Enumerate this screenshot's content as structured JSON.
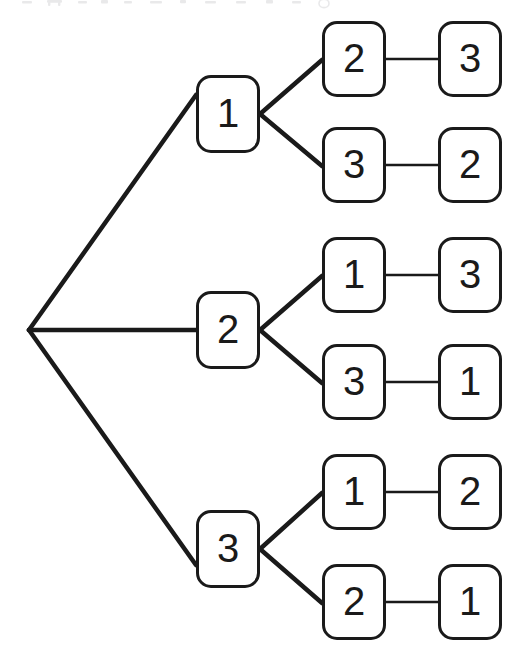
{
  "diagram": {
    "type": "tree",
    "background_color": "#ffffff",
    "stroke_color": "#1a1a1a",
    "node_fill_color": "#ffffff",
    "root": {
      "name": "root-vertex",
      "x": 29,
      "y": 330,
      "label": ""
    },
    "levels": [
      {
        "name": "level-1",
        "column_x": 196
      },
      {
        "name": "level-2",
        "column_x": 322
      },
      {
        "name": "level-3",
        "column_x": 438
      }
    ],
    "nodes": [
      {
        "id": "L1-1",
        "label": "1",
        "level": 1,
        "x": 196,
        "y": 75,
        "w": 64,
        "h": 78
      },
      {
        "id": "L1-2",
        "label": "2",
        "level": 1,
        "x": 196,
        "y": 291,
        "w": 64,
        "h": 78
      },
      {
        "id": "L1-3",
        "label": "3",
        "level": 1,
        "x": 196,
        "y": 510,
        "w": 64,
        "h": 78
      },
      {
        "id": "L2-1",
        "label": "2",
        "level": 2,
        "x": 322,
        "y": 21,
        "w": 64,
        "h": 76
      },
      {
        "id": "L2-2",
        "label": "3",
        "level": 2,
        "x": 322,
        "y": 127,
        "w": 64,
        "h": 76
      },
      {
        "id": "L2-3",
        "label": "1",
        "level": 2,
        "x": 322,
        "y": 237,
        "w": 64,
        "h": 76
      },
      {
        "id": "L2-4",
        "label": "3",
        "level": 2,
        "x": 322,
        "y": 344,
        "w": 64,
        "h": 76
      },
      {
        "id": "L2-5",
        "label": "1",
        "level": 2,
        "x": 322,
        "y": 454,
        "w": 64,
        "h": 76
      },
      {
        "id": "L2-6",
        "label": "2",
        "level": 2,
        "x": 322,
        "y": 564,
        "w": 64,
        "h": 76
      },
      {
        "id": "L3-1",
        "label": "3",
        "level": 3,
        "x": 438,
        "y": 21,
        "w": 64,
        "h": 76
      },
      {
        "id": "L3-2",
        "label": "2",
        "level": 3,
        "x": 438,
        "y": 127,
        "w": 64,
        "h": 76
      },
      {
        "id": "L3-3",
        "label": "3",
        "level": 3,
        "x": 438,
        "y": 237,
        "w": 64,
        "h": 76
      },
      {
        "id": "L3-4",
        "label": "1",
        "level": 3,
        "x": 438,
        "y": 344,
        "w": 64,
        "h": 76
      },
      {
        "id": "L3-5",
        "label": "2",
        "level": 3,
        "x": 438,
        "y": 454,
        "w": 64,
        "h": 76
      },
      {
        "id": "L3-6",
        "label": "1",
        "level": 3,
        "x": 438,
        "y": 564,
        "w": 64,
        "h": 76
      }
    ],
    "edges": [
      {
        "name": "root-to-1",
        "kind": "branch",
        "x1": 29,
        "y1": 330,
        "x2": 196,
        "y2": 95,
        "width": 4.5
      },
      {
        "name": "root-to-2",
        "kind": "branch",
        "x1": 29,
        "y1": 330,
        "x2": 196,
        "y2": 330,
        "width": 4.5
      },
      {
        "name": "root-to-3",
        "kind": "branch",
        "x1": 29,
        "y1": 330,
        "x2": 196,
        "y2": 565,
        "width": 4.5
      },
      {
        "name": "n1-to-2",
        "kind": "branch",
        "x1": 260,
        "y1": 114,
        "x2": 322,
        "y2": 60,
        "width": 4.5
      },
      {
        "name": "n1-to-3",
        "kind": "branch",
        "x1": 260,
        "y1": 114,
        "x2": 322,
        "y2": 166,
        "width": 4.5
      },
      {
        "name": "n2-to-1",
        "kind": "branch",
        "x1": 260,
        "y1": 330,
        "x2": 322,
        "y2": 276,
        "width": 4.5
      },
      {
        "name": "n2-to-3",
        "kind": "branch",
        "x1": 260,
        "y1": 330,
        "x2": 322,
        "y2": 383,
        "width": 4.5
      },
      {
        "name": "n3-to-1",
        "kind": "branch",
        "x1": 260,
        "y1": 549,
        "x2": 322,
        "y2": 493,
        "width": 4.5
      },
      {
        "name": "n3-to-2",
        "kind": "branch",
        "x1": 260,
        "y1": 549,
        "x2": 322,
        "y2": 603,
        "width": 4.5
      },
      {
        "name": "leaf-link-1",
        "kind": "link",
        "x1": 386,
        "y1": 59,
        "x2": 438,
        "y2": 59,
        "width": 2.5
      },
      {
        "name": "leaf-link-2",
        "kind": "link",
        "x1": 386,
        "y1": 165,
        "x2": 438,
        "y2": 165,
        "width": 2.5
      },
      {
        "name": "leaf-link-3",
        "kind": "link",
        "x1": 386,
        "y1": 275,
        "x2": 438,
        "y2": 275,
        "width": 2.5
      },
      {
        "name": "leaf-link-4",
        "kind": "link",
        "x1": 386,
        "y1": 382,
        "x2": 438,
        "y2": 382,
        "width": 2.5
      },
      {
        "name": "leaf-link-5",
        "kind": "link",
        "x1": 386,
        "y1": 492,
        "x2": 438,
        "y2": 492,
        "width": 2.5
      },
      {
        "name": "leaf-link-6",
        "kind": "link",
        "x1": 386,
        "y1": 602,
        "x2": 438,
        "y2": 602,
        "width": 2.5
      }
    ],
    "permutations": [
      {
        "name": "permutation-1",
        "sequence": [
          "1",
          "2",
          "3"
        ],
        "text": "123"
      },
      {
        "name": "permutation-2",
        "sequence": [
          "1",
          "3",
          "2"
        ],
        "text": "132"
      },
      {
        "name": "permutation-3",
        "sequence": [
          "2",
          "1",
          "3"
        ],
        "text": "213"
      },
      {
        "name": "permutation-4",
        "sequence": [
          "2",
          "3",
          "1"
        ],
        "text": "231"
      },
      {
        "name": "permutation-5",
        "sequence": [
          "3",
          "1",
          "2"
        ],
        "text": "312"
      },
      {
        "name": "permutation-6",
        "sequence": [
          "3",
          "2",
          "1"
        ],
        "text": "321"
      }
    ]
  }
}
